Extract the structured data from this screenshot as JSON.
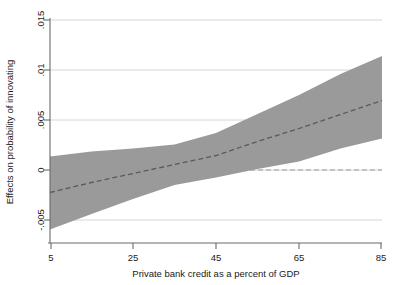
{
  "chart_data": {
    "type": "line",
    "title": "",
    "subtitle": "",
    "xlabel": "Private bank credit as a percent of GDP",
    "ylabel": "Effects on probability of innovating",
    "xlim": [
      5,
      85
    ],
    "ylim": [
      -0.0065,
      0.0155
    ],
    "xticks": [
      5,
      25,
      45,
      65,
      85
    ],
    "xticklabels": [
      "5",
      "25",
      "45",
      "65",
      "85"
    ],
    "yticks": [
      -0.005,
      0,
      0.005,
      0.01,
      0.015
    ],
    "yticklabels": [
      "-.005",
      "0",
      ".005",
      ".01",
      ".015"
    ],
    "grid": "horizontal",
    "legend": "none",
    "x": [
      5,
      15,
      25,
      35,
      45,
      55,
      65,
      75,
      85
    ],
    "series": [
      {
        "name": "Marginal effect",
        "style": "dashed",
        "color": "#5a5a5a",
        "values": [
          -0.00225,
          -0.00125,
          -0.00035,
          0.00055,
          0.00145,
          0.00285,
          0.00415,
          0.00555,
          0.00695
        ]
      },
      {
        "name": "95% CI upper",
        "style": "band-edge",
        "color": "#9a9a9a",
        "values": [
          0.00135,
          0.00185,
          0.00215,
          0.00255,
          0.0037,
          0.0056,
          0.0075,
          0.0096,
          0.0114
        ]
      },
      {
        "name": "95% CI lower",
        "style": "band-edge",
        "color": "#9a9a9a",
        "values": [
          -0.00595,
          -0.0044,
          -0.0029,
          -0.0015,
          -0.00075,
          0.0001,
          0.00085,
          0.00215,
          0.00315
        ]
      }
    ],
    "reference_lines": [
      {
        "name": "zero-line",
        "orientation": "horizontal",
        "value": 0,
        "style": "dashed",
        "color": "#9a9a9a"
      }
    ],
    "band": {
      "name": "confidence-interval-band",
      "fill": "#9a9a9a",
      "upper_series": "95% CI upper",
      "lower_series": "95% CI lower"
    },
    "annotations": []
  },
  "colors": {
    "band_fill": "#9a9a9a",
    "center_line": "#5a5a5a",
    "grid": "#d0d0d0",
    "axis": "#6b6b6b",
    "text": "#1a1a1a",
    "background": "#ffffff"
  }
}
